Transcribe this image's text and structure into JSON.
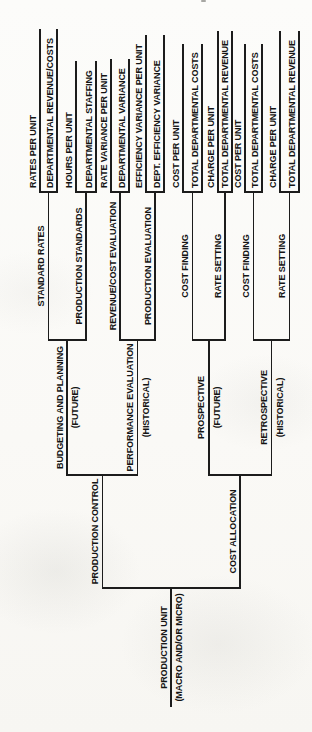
{
  "figure": {
    "type": "bracket-tree",
    "ink_color": "#1c1c1c",
    "paper_color": "#fbfbf9"
  },
  "diagram": {
    "root": {
      "label": "PRODUCTION UNIT",
      "sublabel": "(MACRO AND/OR MICRO)",
      "children": [
        {
          "label": "PRODUCTION CONTROL",
          "children": [
            {
              "label": "BUDGETING AND PLANNING",
              "sublabel": "(FUTURE)",
              "children": [
                {
                  "label": "STANDARD RATES",
                  "children": [
                    {
                      "label": "RATES PER UNIT"
                    },
                    {
                      "label": "DEPARTMENTAL REVENUE/COSTS"
                    }
                  ]
                },
                {
                  "label": "PRODUCTION STANDARDS",
                  "children": [
                    {
                      "label": "HOURS PER UNIT"
                    },
                    {
                      "label": "DEPARTMENTAL STAFFING"
                    }
                  ]
                }
              ]
            },
            {
              "label": "PERFORMANCE EVALUATION",
              "sublabel": "(HISTORICAL)",
              "children": [
                {
                  "label": "REVENUE/COST EVALUATION",
                  "children": [
                    {
                      "label": "RATE VARIANCE PER UNIT"
                    },
                    {
                      "label": "DEPARTMENTAL VARIANCE"
                    }
                  ]
                },
                {
                  "label": "PRODUCTION EVALUATION",
                  "children": [
                    {
                      "label": "EFFICIENCY VARIANCE PER UNIT"
                    },
                    {
                      "label": "DEPT. EFFICIENCY VARIANCE"
                    }
                  ]
                }
              ]
            }
          ]
        },
        {
          "label": "COST ALLOCATION",
          "children": [
            {
              "label": "PROSPECTIVE",
              "sublabel": "(FUTURE)",
              "children": [
                {
                  "label": "COST FINDING",
                  "children": [
                    {
                      "label": "COST PER UNIT"
                    },
                    {
                      "label": "TOTAL DEPARTMENTAL COSTS"
                    }
                  ]
                },
                {
                  "label": "RATE SETTING",
                  "children": [
                    {
                      "label": "CHARGE PER UNIT"
                    },
                    {
                      "label": "TOTAL DEPARTMENTAL REVENUE"
                    }
                  ]
                }
              ]
            },
            {
              "label": "RETROSPECTIVE",
              "sublabel": "(HISTORICAL)",
              "children": [
                {
                  "label": "COST FINDING",
                  "children": [
                    {
                      "label": "COST PER UNIT"
                    },
                    {
                      "label": "TOTAL DEPARTMENTAL COSTS"
                    }
                  ]
                },
                {
                  "label": "RATE SETTING",
                  "children": [
                    {
                      "label": "CHARGE PER UNIT"
                    },
                    {
                      "label": "TOTAL DEPARTMENTAL REVENUE"
                    }
                  ]
                }
              ]
            }
          ]
        }
      ]
    }
  }
}
